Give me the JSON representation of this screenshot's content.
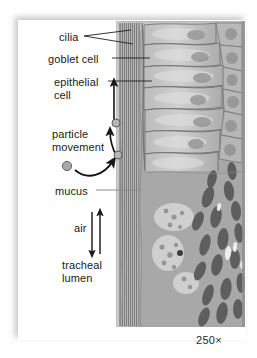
{
  "figure": {
    "magnification": "250×",
    "background_color": "#ffffff",
    "label_color": "#1a1a1a",
    "leader_color": "#222222"
  },
  "labels": {
    "cilia": "cilia",
    "goblet_cell": "goblet cell",
    "epithelial_cell": "epithelial\ncell",
    "particle_movement": "particle\nmovement",
    "mucus": "mucus",
    "air": "air",
    "tracheal_lumen": "tracheal\nlumen"
  },
  "annotations": {
    "cilia_leader": "forked-leader-two-lines",
    "goblet_leader": "straight-leader",
    "epithelial_leader": "straight-leader",
    "mucus_leader": "straight-leader",
    "particle_arrow_up": "curved-arrow-up",
    "particle_arrow_curve": "curved-arrow-right",
    "epithelial_arrow": "straight-arrow-up",
    "air_arrow_up": "arrow-up",
    "air_arrow_down": "arrow-down",
    "particles": [
      {
        "name": "particle-upper",
        "cx": 116,
        "cy": 123,
        "r": 4
      },
      {
        "name": "particle-middle",
        "cx": 118,
        "cy": 155,
        "r": 4
      },
      {
        "name": "particle-free",
        "cx": 67,
        "cy": 166,
        "r": 5
      }
    ]
  },
  "micrograph": {
    "description": "Grayscale light micrograph of pseudostratified ciliated columnar epithelium lining the trachea",
    "cilia_band_label": "cilia-band",
    "cell_layer_label": "columnar-cell-layer",
    "nuclei_layer_label": "basal-nuclei-layer",
    "lumen_side": "left",
    "base_tint": "#a9a9a9"
  }
}
